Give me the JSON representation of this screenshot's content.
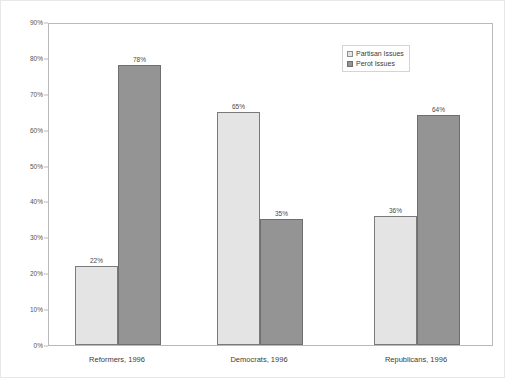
{
  "chart_data": {
    "type": "bar",
    "title": "",
    "subtitle": "",
    "xlabel": "",
    "ylabel": "",
    "ylim": [
      0,
      90
    ],
    "ytick_labels": [
      "0%",
      "10%",
      "20%",
      "30%",
      "40%",
      "50%",
      "60%",
      "70%",
      "80%",
      "90%"
    ],
    "ytick_values": [
      0,
      10,
      20,
      30,
      40,
      50,
      60,
      70,
      80,
      90
    ],
    "grid": false,
    "legend_position": "top-right",
    "categories": [
      "Reformers, 1996",
      "Democrats, 1996",
      "Republicans, 1996"
    ],
    "series": [
      {
        "name": "Partisan Issues",
        "color": "#e4e4e4",
        "edge_color": "#7a7a7a",
        "values": [
          22,
          65,
          36
        ],
        "data_labels": [
          "22%",
          "65%",
          "36%"
        ]
      },
      {
        "name": "Perot Issues",
        "color": "#949494",
        "edge_color": "#6e6e6e",
        "values": [
          78,
          35,
          64
        ],
        "data_labels": [
          "78%",
          "35%",
          "64%"
        ]
      }
    ]
  },
  "legend": {
    "items": [
      {
        "label": "Partisan Issues"
      },
      {
        "label": "Perot Issues"
      }
    ]
  },
  "colors": {
    "partisan": "#e4e4e4",
    "perot": "#949494",
    "axis": "#b9b9b9",
    "text": "#3c3c3c",
    "background": "#ffffff"
  }
}
